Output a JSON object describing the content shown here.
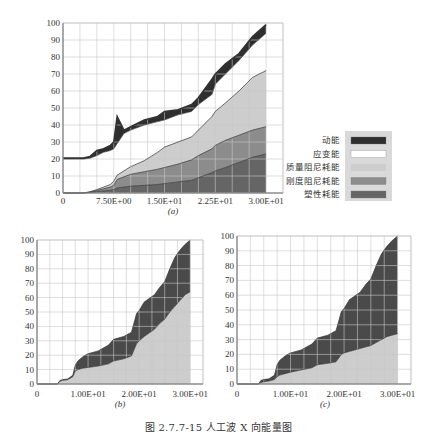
{
  "caption": "图 2.7.7-15   人工波 X 向能量图",
  "colors": {
    "kinetic": "#2e2e2e",
    "strain": "#ffffff",
    "mass_damping": "#cdcdcd",
    "stiffness_damping": "#8c8c8c",
    "plastic": "#656565",
    "grid": "#c8c8c8",
    "legend_bg": "#d9d9d9"
  },
  "legend": {
    "items": [
      {
        "label": "动能",
        "key": "kinetic"
      },
      {
        "label": "应变能",
        "key": "strain"
      },
      {
        "label": "质量阻尼耗能",
        "key": "mass_damping"
      },
      {
        "label": "刚度阻尼耗能",
        "key": "stiffness_damping"
      },
      {
        "label": "塑性耗能",
        "key": "plastic"
      }
    ]
  },
  "chart_data": [
    {
      "id": "a",
      "type": "area",
      "title": "(a)",
      "subtitle_label": "(a)",
      "stacked": true,
      "xlabel": "",
      "ylabel": "",
      "xlim": [
        0,
        32.5
      ],
      "ylim": [
        0,
        100
      ],
      "x_ticks": [
        0,
        7.5,
        15,
        22.5,
        30
      ],
      "x_tick_labels": [
        "0",
        "7.50E+00",
        "1.50E+01",
        "2.25E+01",
        "3.00E+01"
      ],
      "y_ticks": [
        0,
        10,
        20,
        30,
        40,
        50,
        60,
        70,
        80,
        90,
        100
      ],
      "grid": true,
      "legend_position": "right",
      "x": [
        0,
        3,
        4,
        5,
        6,
        7,
        7.5,
        8,
        9,
        10,
        12,
        14,
        15,
        17,
        19,
        20,
        22,
        22.5,
        24,
        26,
        28,
        30
      ],
      "series_cumulative_top": [
        {
          "name": "塑性耗能",
          "key": "plastic",
          "values": [
            0,
            0,
            0.3,
            0.8,
            1.2,
            1.6,
            2,
            3,
            3.5,
            4,
            4.5,
            5,
            5.5,
            6.5,
            7.5,
            9,
            12,
            13,
            15,
            18,
            21,
            23
          ]
        },
        {
          "name": "刚度阻尼耗能",
          "key": "stiffness_damping",
          "values": [
            0,
            0,
            0.5,
            1.5,
            2.5,
            3.5,
            4.5,
            8,
            9.5,
            11,
            12.5,
            14,
            15,
            17,
            19.5,
            22,
            26,
            28,
            31,
            34,
            37,
            39
          ]
        },
        {
          "name": "质量阻尼耗能",
          "key": "mass_damping",
          "values": [
            0,
            0,
            0.8,
            2,
            3.5,
            5,
            7,
            10.5,
            13,
            15.5,
            19,
            24,
            27,
            30,
            33,
            37,
            45,
            48,
            53,
            60,
            68,
            72
          ]
        },
        {
          "name": "应变能",
          "key": "strain",
          "values": [
            20,
            20,
            20.5,
            22,
            24,
            25,
            26,
            29,
            35,
            37,
            40,
            42,
            43,
            46,
            48,
            52,
            58,
            64,
            70,
            78,
            87,
            94
          ]
        },
        {
          "name": "动能",
          "key": "kinetic",
          "values": [
            20.5,
            20.5,
            21.5,
            25,
            26,
            28,
            30,
            45,
            37,
            39,
            43,
            45,
            48,
            49,
            52,
            56,
            67,
            70,
            76,
            82,
            92,
            99
          ]
        }
      ]
    },
    {
      "id": "b",
      "type": "area",
      "title": "(b)",
      "subtitle_label": "(b)",
      "stacked": true,
      "xlim": [
        0,
        32.5
      ],
      "ylim": [
        0,
        100
      ],
      "x_ticks": [
        0,
        10,
        20,
        30
      ],
      "x_tick_labels": [
        "0",
        "1.00E+01",
        "2.00E+01",
        "3.00E+01"
      ],
      "y_ticks": [
        0,
        10,
        20,
        30,
        40,
        50,
        60,
        70,
        80,
        90,
        100
      ],
      "grid": true,
      "x": [
        0,
        4,
        4.5,
        5,
        6,
        7,
        7.5,
        8,
        9,
        10,
        12,
        14,
        15,
        17,
        18.5,
        19.5,
        20,
        21,
        23,
        24,
        25,
        26,
        27,
        28,
        29,
        30
      ],
      "series_cumulative_top": [
        {
          "name": "lower (light)",
          "key": "mass_damping",
          "values": [
            0,
            0,
            2,
            2.5,
            3,
            5,
            9,
            10,
            11,
            11.5,
            12.5,
            14,
            16,
            17.5,
            19.5,
            28,
            30,
            33,
            38,
            42,
            45,
            50,
            54,
            58,
            62,
            64
          ]
        },
        {
          "name": "upper (dark)",
          "key": "plastic_dark",
          "values": [
            0,
            0,
            2.5,
            3,
            3.5,
            6,
            13,
            16,
            19,
            21,
            23,
            27,
            31,
            33,
            36,
            49,
            51,
            57,
            62,
            67,
            71,
            80,
            88,
            93,
            97,
            100
          ]
        }
      ]
    },
    {
      "id": "c",
      "type": "area",
      "title": "(c)",
      "subtitle_label": "(c)",
      "stacked": true,
      "xlim": [
        0,
        32.5
      ],
      "ylim": [
        0,
        100
      ],
      "x_ticks": [
        0,
        10,
        20,
        30
      ],
      "x_tick_labels": [
        "0",
        "1.00E+01",
        "2.00E+01",
        "3.00E+01"
      ],
      "y_ticks": [
        0,
        10,
        20,
        30,
        40,
        50,
        60,
        70,
        80,
        90,
        100
      ],
      "grid": true,
      "x": [
        0,
        4,
        4.5,
        5,
        6,
        7,
        7.5,
        8,
        9,
        10,
        12,
        14,
        15,
        17,
        18.5,
        19.5,
        20,
        21,
        23,
        24,
        25,
        26,
        27,
        28,
        29,
        30
      ],
      "series_cumulative_top": [
        {
          "name": "lower (light)",
          "key": "mass_damping",
          "values": [
            0,
            0,
            1,
            1.5,
            2,
            3,
            5,
            6,
            7,
            8,
            9.5,
            11,
            13,
            14,
            15,
            20,
            21,
            22,
            24,
            25,
            26,
            28,
            30,
            32,
            33,
            34
          ]
        },
        {
          "name": "upper (dark)",
          "key": "plastic_dark",
          "values": [
            0,
            0,
            2.5,
            3,
            3.5,
            6,
            13,
            16,
            19,
            21,
            23,
            27,
            31,
            33,
            36,
            49,
            51,
            57,
            62,
            67,
            71,
            80,
            88,
            93,
            97,
            100
          ]
        }
      ]
    }
  ]
}
